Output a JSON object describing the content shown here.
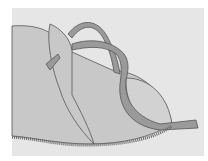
{
  "illustration": {
    "subject": "shoe upper with strap threaded through slot",
    "colors": {
      "page": "#ffffff",
      "panel": "#e6e6e6",
      "leather": "#c8c8c8",
      "leather_light": "#d2d2d2",
      "strap": "#9a9a9a",
      "outline": "#555555",
      "stitch": "#666666"
    }
  }
}
